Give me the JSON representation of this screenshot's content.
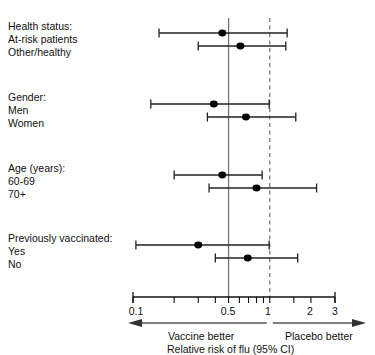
{
  "chart_data": {
    "type": "forest",
    "title": "",
    "xlabel": "Relative risk of flu (95% CI)",
    "ylabel": "",
    "scale": "log",
    "xlim": [
      0.1,
      3
    ],
    "grid": false,
    "reference_lines": [
      {
        "name": "pooled-estimate-line",
        "value": 0.5,
        "style": "solid",
        "color": "#6f6f6f"
      },
      {
        "name": "null-effect-line",
        "value": 1.0,
        "style": "dashed",
        "color": "#6f6f6f"
      }
    ],
    "tick_values": [
      0.1,
      0.2,
      0.3,
      0.4,
      0.5,
      0.6,
      0.7,
      0.8,
      0.9,
      1,
      1.5,
      2,
      3
    ],
    "tick_labels": [
      {
        "value": 0.1,
        "label": "0.1"
      },
      {
        "value": 0.5,
        "label": "0.5"
      },
      {
        "value": 1,
        "label": "1"
      },
      {
        "value": 2,
        "label": "2"
      },
      {
        "value": 3,
        "label": "3"
      }
    ],
    "direction_labels": {
      "left": "Vaccine better",
      "right": "Placebo better",
      "split_value": 1.0
    },
    "groups": [
      {
        "heading": "Health status:",
        "rows": [
          {
            "label": "At-risk patients",
            "estimate": 0.45,
            "low": 0.155,
            "high": 1.34
          },
          {
            "label": "Other/healthy",
            "estimate": 0.61,
            "low": 0.3,
            "high": 1.31
          }
        ]
      },
      {
        "heading": "Gender:",
        "rows": [
          {
            "label": "Men",
            "estimate": 0.39,
            "low": 0.135,
            "high": 0.99
          },
          {
            "label": "Women",
            "estimate": 0.67,
            "low": 0.35,
            "high": 1.55
          }
        ]
      },
      {
        "heading": "Age (years):",
        "rows": [
          {
            "label": "60-69",
            "estimate": 0.45,
            "low": 0.2,
            "high": 0.88
          },
          {
            "label": "70+",
            "estimate": 0.8,
            "low": 0.36,
            "high": 2.2
          }
        ]
      },
      {
        "heading": "Previously vaccinated:",
        "rows": [
          {
            "label": "Yes",
            "estimate": 0.3,
            "low": 0.105,
            "high": 0.99
          },
          {
            "label": "No",
            "estimate": 0.69,
            "low": 0.4,
            "high": 1.6
          }
        ]
      }
    ]
  },
  "axis": {
    "x_axis_name": "x-axis",
    "title": "Relative risk of flu (95% CI)"
  },
  "labels": {
    "group1_heading": "Health status:",
    "group1_row1": "At-risk patients",
    "group1_row2": "Other/healthy",
    "group2_heading": "Gender:",
    "group2_row1": "Men",
    "group2_row2": "Women",
    "group3_heading": "Age (years):",
    "group3_row1": "60-69",
    "group3_row2": "70+",
    "group4_heading": "Previously vaccinated:",
    "group4_row1": "Yes",
    "group4_row2": "No",
    "tick_0_1": "0.1",
    "tick_0_5": "0.5",
    "tick_1": "1",
    "tick_2": "2",
    "tick_3": "3",
    "vaccine_better": "Vaccine better",
    "placebo_better": "Placebo better",
    "axis_title": "Relative risk of flu (95% CI)"
  },
  "colors": {
    "marker": "#000000",
    "line": "#222222",
    "reference": "#6f6f6f",
    "text": "#111111"
  }
}
